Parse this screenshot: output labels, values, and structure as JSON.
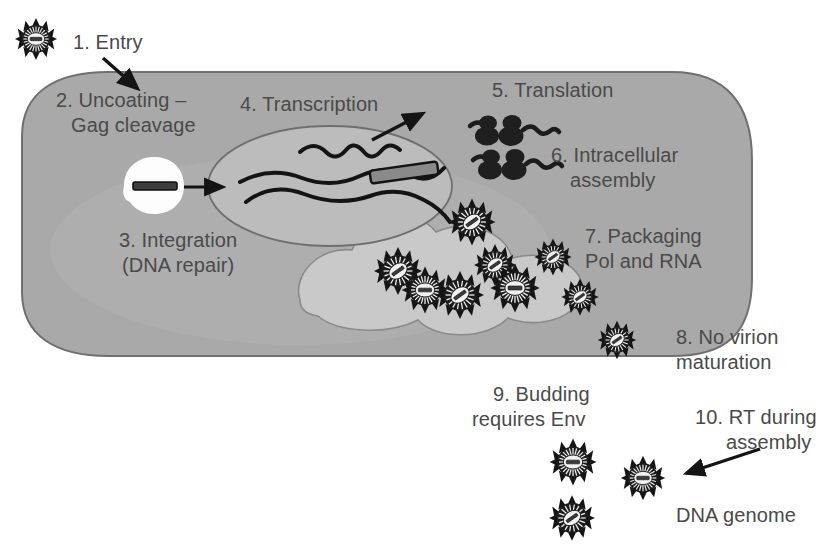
{
  "figure": {
    "type": "biological-process-diagram",
    "background_color": "#ffffff",
    "cell_fill_color": "#a9a9a9",
    "cell_stroke_color": "#6e6e6e",
    "nucleus_fill_color": "#b9b9b9",
    "nucleus_stroke_color": "#6e6e6e",
    "compartment_fill_color": "#c6c6c6",
    "text_color": "#4a4a4a",
    "ink_color": "#1c1c1c"
  },
  "steps": [
    {
      "id": 1,
      "number": "1.",
      "label": "1. Entry",
      "lines": [
        "1. Entry"
      ]
    },
    {
      "id": 2,
      "number": "2.",
      "label": "2. Uncoating – Gag cleavage",
      "lines": [
        "2. Uncoating –",
        "Gag cleavage"
      ]
    },
    {
      "id": 3,
      "number": "3.",
      "label": "3. Integration (DNA repair)",
      "lines": [
        "3. Integration",
        "(DNA repair)"
      ]
    },
    {
      "id": 4,
      "number": "4.",
      "label": "4. Transcription",
      "lines": [
        "4. Transcription"
      ]
    },
    {
      "id": 5,
      "number": "5.",
      "label": "5. Translation",
      "lines": [
        "5. Translation"
      ]
    },
    {
      "id": 6,
      "number": "6.",
      "label": "6. Intracellular assembly",
      "lines": [
        "6. Intracellular",
        "assembly"
      ]
    },
    {
      "id": 7,
      "number": "7.",
      "label": "7. Packaging Pol and RNA",
      "lines": [
        "7. Packaging",
        "Pol and RNA"
      ]
    },
    {
      "id": 8,
      "number": "8.",
      "label": "8. No virion maturation",
      "lines": [
        "8. No virion",
        "maturation"
      ]
    },
    {
      "id": 9,
      "number": "9.",
      "label": "9. Budding requires Env",
      "lines": [
        "9. Budding",
        "requires Env"
      ]
    },
    {
      "id": 10,
      "number": "10.",
      "label": "10. RT during assembly",
      "lines": [
        "10. RT during",
        "assembly"
      ]
    }
  ],
  "labels": {
    "step1": "1. Entry",
    "step2_line1": "2. Uncoating –",
    "step2_line2": "Gag cleavage",
    "step3_line1": "3. Integration",
    "step3_line2": "(DNA repair)",
    "step4": "4. Transcription",
    "step5": "5. Translation",
    "step6_line1": "6. Intracellular",
    "step6_line2": "assembly",
    "step7_line1": "7. Packaging",
    "step7_line2": "Pol and RNA",
    "step8_line1": "8. No virion",
    "step8_line2": "maturation",
    "step9_line1": "9. Budding",
    "step9_line2": "requires Env",
    "step10_line1": "10. RT during",
    "step10_line2": "assembly",
    "dna_genome": "DNA genome"
  },
  "structures": {
    "cell": {
      "name": "host-cell",
      "shape": "rounded-rectangle"
    },
    "nucleus": {
      "name": "nucleus",
      "shape": "ellipse"
    },
    "capsid": {
      "name": "uncoating-capsid",
      "contents": "viral-genome-bar"
    },
    "assembly_compartment": {
      "name": "intracellular-assembly-compartment"
    },
    "ribosomes": {
      "name": "ribosome-mrna-complex",
      "count": 4
    },
    "provirus": {
      "name": "integrated-provirus-bar"
    },
    "mrna_transcript": {
      "name": "mrna-transcript"
    }
  },
  "virions": {
    "extracellular_entry": 1,
    "intracellular_assembling": 8,
    "budding_at_membrane": 1,
    "released_free": 3,
    "description": "dark enveloped particle with radiating spikes and pale core containing genome bar"
  },
  "arrows": {
    "entry": "virion entering cell at upper-left membrane",
    "uncoating_to_nucleus": "capsid genome to nucleus",
    "transcription_export": "mRNA exiting nucleus toward ribosomes",
    "rt_during_assembly": "pointing to released virions"
  }
}
